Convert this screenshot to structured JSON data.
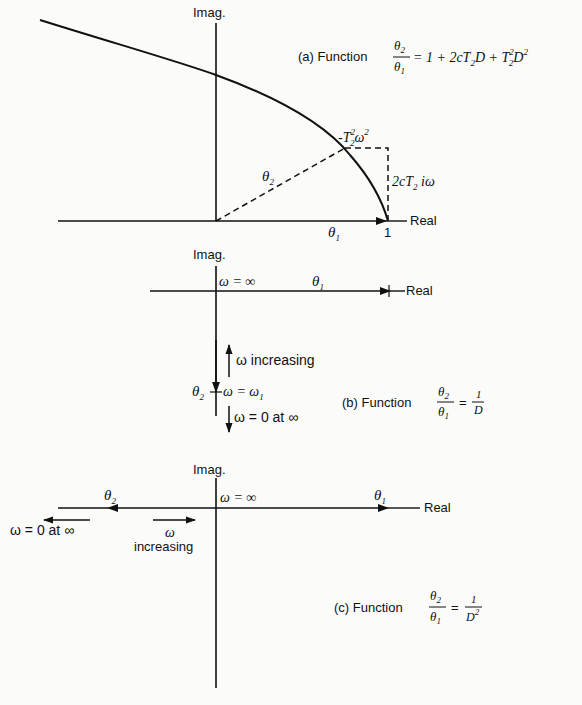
{
  "figure": {
    "panel_a": {
      "caption_prefix": "(a) Function",
      "frac_num": "θ",
      "frac_num_sub": "2",
      "frac_den": "θ",
      "frac_den_sub": "1",
      "equation_rhs": "= 1 + 2cT",
      "rhs_sub1": "2",
      "rhs_D": "D + T",
      "rhs_sup2": "2",
      "rhs_sub2": "2",
      "rhs_D2": "D",
      "rhs_sup3": "2",
      "imag_label": "Imag.",
      "real_label": "Real",
      "unit_tick_label": "1",
      "theta1_label": "θ",
      "theta1_sub": "1",
      "theta2_label": "θ",
      "theta2_sub": "2",
      "real_term_label": "-T",
      "real_term_sup": "2",
      "real_term_sub": "2",
      "real_term_omega": "ω",
      "real_term_omega_sup": "2",
      "imag_term_label": "2cT",
      "imag_term_sub": "2",
      "imag_term_suffix": " iω"
    },
    "panel_b": {
      "caption_prefix": "(b) Function",
      "frac_num": "θ",
      "frac_num_sub": "2",
      "frac_den": "θ",
      "frac_den_sub": "1",
      "rhs_eq": "=",
      "rhs_num": "1",
      "rhs_den": "D",
      "imag_label": "Imag.",
      "real_label": "Real",
      "omega_inf_label": "ω = ∞",
      "theta1_label": "θ",
      "theta1_sub": "1",
      "theta2_label": "θ",
      "theta2_sub": "2",
      "omega_increasing_label": "ω increasing",
      "omega_w1_label": "ω = ω",
      "omega_w1_sub": "1",
      "omega_zero_label": "ω = 0 at ∞"
    },
    "panel_c": {
      "caption_prefix": "(c) Function",
      "frac_num": "θ",
      "frac_num_sub": "2",
      "frac_den": "θ",
      "frac_den_sub": "1",
      "rhs_eq": "=",
      "rhs_num": "1",
      "rhs_den": "D",
      "rhs_den_sup": "2",
      "imag_label": "Imag.",
      "real_label": "Real",
      "omega_inf_label": "ω = ∞",
      "theta1_label": "θ",
      "theta1_sub": "1",
      "theta2_label": "θ",
      "theta2_sub": "2",
      "omega_zero_label": "ω = 0 at ∞",
      "omega_label": "ω",
      "increasing_label": "increasing"
    }
  }
}
